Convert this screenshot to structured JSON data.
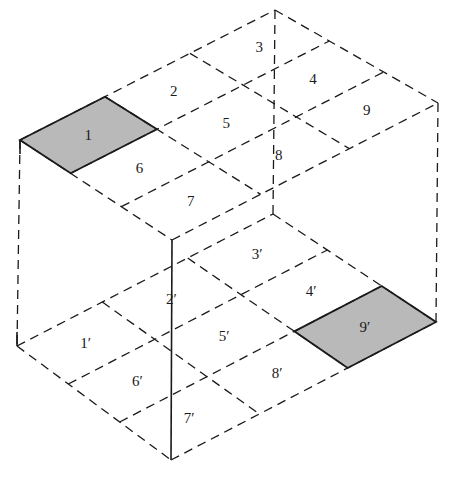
{
  "diagram": {
    "type": "isometric box with 3x3 grid on top and bottom faces",
    "colors": {
      "line": "#1a1a1a",
      "shaded_cell": "#b9b9b9",
      "background": "#ffffff"
    },
    "top_face": {
      "corners": {
        "left": [
          20,
          140
        ],
        "back": [
          275,
          10
        ],
        "right": [
          438,
          103
        ],
        "front": [
          172,
          240
        ]
      },
      "cells": [
        {
          "label": "1",
          "u": 0,
          "v": 0,
          "shaded": true
        },
        {
          "label": "2",
          "u": 1,
          "v": 0,
          "shaded": false
        },
        {
          "label": "3",
          "u": 2,
          "v": 0,
          "shaded": false
        },
        {
          "label": "6",
          "u": 0,
          "v": 1,
          "shaded": false
        },
        {
          "label": "5",
          "u": 1,
          "v": 1,
          "shaded": false
        },
        {
          "label": "4",
          "u": 2,
          "v": 1,
          "shaded": false
        },
        {
          "label": "7",
          "u": 0,
          "v": 2,
          "shaded": false
        },
        {
          "label": "8",
          "u": 1,
          "v": 2,
          "shaded": false
        },
        {
          "label": "9",
          "u": 2,
          "v": 2,
          "shaded": false
        }
      ]
    },
    "bottom_face": {
      "corners": {
        "left": [
          17,
          346
        ],
        "back": [
          273,
          214
        ],
        "right": [
          436,
          322
        ],
        "front": [
          171,
          460
        ]
      },
      "cells": [
        {
          "label": "1′",
          "u": 0,
          "v": 0,
          "shaded": false
        },
        {
          "label": "2′",
          "u": 1,
          "v": 0,
          "shaded": false
        },
        {
          "label": "3′",
          "u": 2,
          "v": 0,
          "shaded": false
        },
        {
          "label": "6′",
          "u": 0,
          "v": 1,
          "shaded": false
        },
        {
          "label": "5′",
          "u": 1,
          "v": 1,
          "shaded": false
        },
        {
          "label": "4′",
          "u": 2,
          "v": 1,
          "shaded": false
        },
        {
          "label": "7′",
          "u": 0,
          "v": 2,
          "shaded": false
        },
        {
          "label": "8′",
          "u": 1,
          "v": 2,
          "shaded": false
        },
        {
          "label": "9′",
          "u": 2,
          "v": 2,
          "shaded": true
        }
      ]
    }
  }
}
